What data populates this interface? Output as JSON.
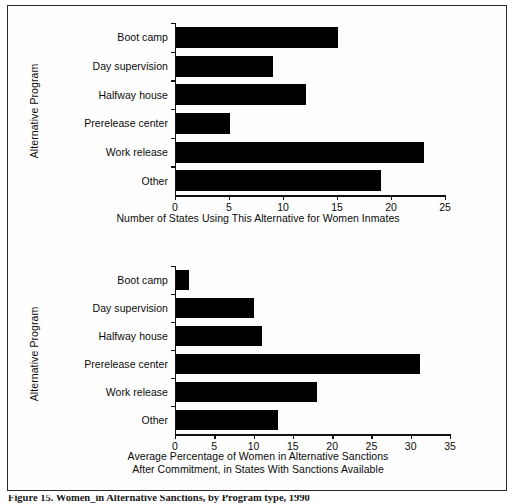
{
  "figure": {
    "caption": "Figure 15. Women_in Alternative Sanctions, by Program type, 1990"
  },
  "chart_data": [
    {
      "id": "top",
      "type": "bar",
      "orientation": "horizontal",
      "title": "",
      "xlabel": "Number of States Using This Alternative for Women Inmates",
      "ylabel": "Alternative Program",
      "categories": [
        "Boot camp",
        "Day supervision",
        "Halfway house",
        "Prerelease center",
        "Work release",
        "Other"
      ],
      "values": [
        15,
        9,
        12,
        5,
        23,
        19
      ],
      "xlim": [
        0,
        25
      ],
      "xticks": [
        0,
        5,
        10,
        15,
        20,
        25
      ],
      "xticklabels": [
        "0",
        "5",
        "10",
        "15",
        "20",
        "25"
      ],
      "grid": false,
      "legend": false,
      "bar_color": "#000000"
    },
    {
      "id": "bottom",
      "type": "bar",
      "orientation": "horizontal",
      "title": "",
      "xlabel_line1": "Average Percentage of Women in Alternative Sanctions",
      "xlabel_line2": "After Commitment, in States With Sanctions Available",
      "ylabel": "Alternative Program",
      "categories": [
        "Boot camp",
        "Day supervision",
        "Halfway house",
        "Prerelease center",
        "Work release",
        "Other"
      ],
      "values": [
        1.7,
        9.9,
        11,
        31,
        18,
        13
      ],
      "xlim": [
        0,
        35
      ],
      "xticks": [
        0,
        5,
        10,
        15,
        20,
        25,
        30,
        35
      ],
      "xticklabels": [
        "0",
        "5",
        "10",
        "15",
        "20",
        "25",
        "30",
        "35"
      ],
      "grid": false,
      "legend": false,
      "bar_color": "#000000"
    }
  ]
}
